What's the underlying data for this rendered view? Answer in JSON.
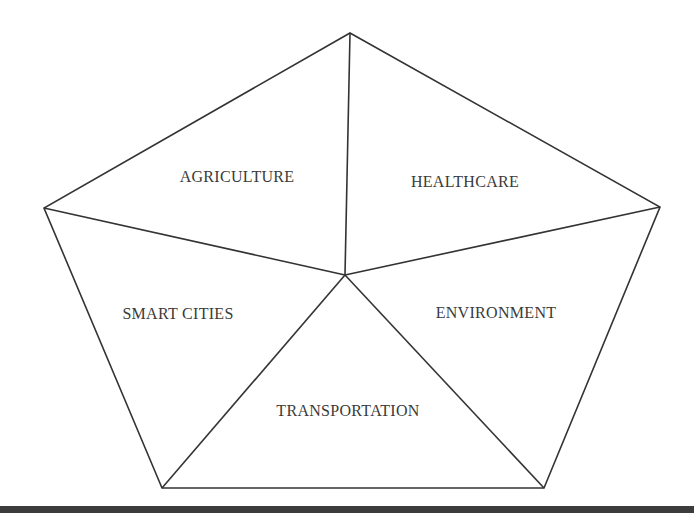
{
  "diagram": {
    "shape": "pentagon divided into five triangular segments",
    "segments": [
      {
        "label": "AGRICULTURE",
        "x": 237,
        "y": 177
      },
      {
        "label": "HEALTHCARE",
        "x": 465,
        "y": 182
      },
      {
        "label": "SMART CITIES",
        "x": 178,
        "y": 314
      },
      {
        "label": "ENVIRONMENT",
        "x": 496,
        "y": 313
      },
      {
        "label": "TRANSPORTATION",
        "x": 348,
        "y": 411
      }
    ],
    "vertices": {
      "top": [
        350,
        33
      ],
      "left": [
        44,
        208
      ],
      "right": [
        660,
        207
      ],
      "bottom_left": [
        162,
        488
      ],
      "bottom_right": [
        544,
        488
      ],
      "center": [
        345,
        275
      ]
    },
    "line_color": "#333333",
    "bar_color": "#3c3c3c"
  }
}
